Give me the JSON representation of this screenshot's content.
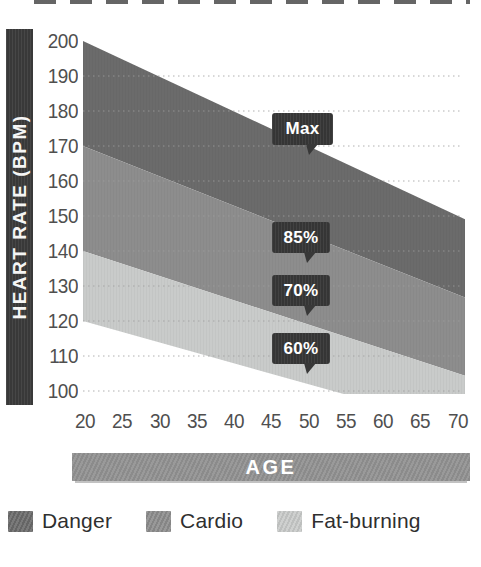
{
  "chart_data": {
    "type": "area",
    "title": "",
    "xlabel": "AGE",
    "ylabel": "HEART RATE (BPM)",
    "x_ticks": [
      20,
      25,
      30,
      35,
      40,
      45,
      50,
      55,
      60,
      65,
      70
    ],
    "y_ticks": [
      200,
      190,
      180,
      170,
      160,
      150,
      140,
      130,
      120,
      110,
      100
    ],
    "x_range": [
      20,
      70
    ],
    "y_range": [
      100,
      200
    ],
    "grid": "horizontal-dotted",
    "legend_position": "bottom",
    "series": [
      {
        "name": "Maximum heart rate (220 minus age)",
        "label": "Max",
        "x": [
          20,
          70
        ],
        "values": [
          200,
          150
        ]
      },
      {
        "name": "85% of maximum heart rate",
        "label": "85%",
        "x": [
          20,
          70
        ],
        "values": [
          170,
          127.5
        ]
      },
      {
        "name": "70% of maximum heart rate",
        "label": "70%",
        "x": [
          20,
          70
        ],
        "values": [
          140,
          105
        ]
      },
      {
        "name": "60% of maximum heart rate",
        "label": "60%",
        "x": [
          20,
          70
        ],
        "values": [
          120,
          90
        ]
      }
    ],
    "zones": [
      {
        "name": "Danger",
        "between": [
          "Max",
          "85%"
        ],
        "color": "#6b6b6b"
      },
      {
        "name": "Cardio",
        "between": [
          "85%",
          "70%"
        ],
        "color": "#8d8d8d"
      },
      {
        "name": "Fat-burning",
        "between": [
          "70%",
          "60%"
        ],
        "color": "#c9cbca"
      }
    ],
    "callouts": [
      {
        "label": "Max"
      },
      {
        "label": "85%"
      },
      {
        "label": "70%"
      },
      {
        "label": "60%"
      }
    ]
  },
  "legend": {
    "items": [
      {
        "label": "Danger",
        "color": "#6b6b6b"
      },
      {
        "label": "Cardio",
        "color": "#8d8d8d"
      },
      {
        "label": "Fat-burning",
        "color": "#c9cbca"
      }
    ]
  },
  "colors": {
    "axis_bar": "#3c3c3c",
    "callout_bubble": "#383838",
    "age_bar": "#929292",
    "tick_text": "#4f4f4f",
    "gridline": "#9e9e9e",
    "background": "#ffffff"
  }
}
